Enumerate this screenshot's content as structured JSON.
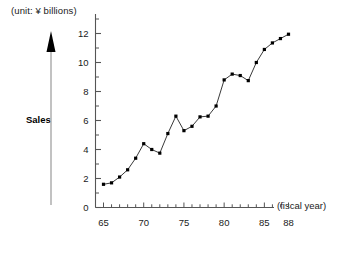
{
  "chart_data": {
    "type": "line",
    "title": "",
    "subtitle": "",
    "unit_label": "(unit: ¥ billions)",
    "ylabel": "Sales",
    "xlabel": "(fiscal year)",
    "x": [
      65,
      66,
      67,
      68,
      69,
      70,
      71,
      72,
      73,
      74,
      75,
      76,
      77,
      78,
      79,
      80,
      81,
      82,
      83,
      84,
      85,
      86,
      87,
      88
    ],
    "values": [
      1.6,
      1.7,
      2.1,
      2.6,
      3.4,
      4.4,
      4.0,
      3.75,
      5.1,
      6.3,
      5.3,
      5.6,
      6.25,
      6.3,
      7.0,
      8.8,
      9.2,
      9.1,
      8.75,
      10.0,
      10.9,
      11.35,
      11.65,
      11.95
    ],
    "series": [
      {
        "name": "Sales",
        "values": [
          1.6,
          1.7,
          2.1,
          2.6,
          3.4,
          4.4,
          4.0,
          3.75,
          5.1,
          6.3,
          5.3,
          5.6,
          6.25,
          6.3,
          7.0,
          8.8,
          9.2,
          9.1,
          8.75,
          10.0,
          10.9,
          11.35,
          11.65,
          11.95
        ]
      }
    ],
    "ylim": [
      0,
      13
    ],
    "xlim": [
      64,
      89
    ],
    "ytick_labels": [
      "12",
      "10",
      "8",
      "6",
      "4",
      "2",
      "0"
    ],
    "ytick_values": [
      12,
      10,
      8,
      6,
      4,
      2,
      0
    ],
    "yminor_values": [
      13,
      11,
      9,
      7,
      5,
      3,
      1
    ],
    "xtick_values": [
      65,
      66,
      67,
      68,
      69,
      70,
      71,
      72,
      73,
      74,
      75,
      76,
      77,
      78,
      79,
      80,
      81,
      82,
      83,
      84,
      85,
      86,
      87,
      88
    ],
    "xtick_labels": [
      {
        "value": 65,
        "label": "65"
      },
      {
        "value": 70,
        "label": "70"
      },
      {
        "value": 75,
        "label": "75"
      },
      {
        "value": 80,
        "label": "80"
      },
      {
        "value": 85,
        "label": "85"
      },
      {
        "value": 88,
        "label": "88"
      }
    ],
    "grid": false,
    "legend": "none",
    "marker": "filled-square",
    "line_color": "#3a3a3a",
    "marker_color": "#000000",
    "axis_color": "#555555",
    "arrow_color": "#999999",
    "arrow_head_color": "#000000"
  }
}
